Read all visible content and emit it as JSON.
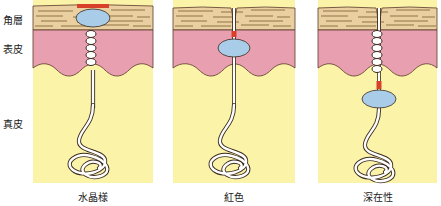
{
  "layer_labels": {
    "stratum_corneum": "角層",
    "epidermis": "表皮",
    "dermis": "真皮"
  },
  "panels": [
    {
      "caption": "水晶様",
      "vesicle_layer": "stratum_corneum"
    },
    {
      "caption": "紅色",
      "vesicle_layer": "epidermis"
    },
    {
      "caption": "深在性",
      "vesicle_layer": "dermis"
    }
  ],
  "colors": {
    "stratum_corneum": "#ead0a0",
    "epidermis": "#e8a0b0",
    "dermis": "#fbf3a8",
    "vesicle": "#a9cde8",
    "obstruction": "#d9402a",
    "outline": "#5a3a2a"
  }
}
